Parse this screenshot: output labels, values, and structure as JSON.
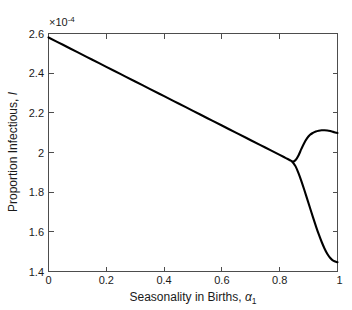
{
  "figure": {
    "background_color": "#ffffff",
    "curve_color": "#000000",
    "axis_color": "#4d4d4d"
  },
  "axes": {
    "x_title_main": "Seasonality in Births, ",
    "x_title_symbol": "α",
    "x_title_subscript": "1",
    "y_title_main": "Proportion Infectious, ",
    "y_title_symbol": "I",
    "exponent_mantissa": "×10",
    "exponent_power": "-4",
    "x_ticklabels": [
      "0",
      "0.2",
      "0.4",
      "0.6",
      "0.8",
      "1"
    ],
    "y_ticklabels": [
      "1.4",
      "1.6",
      "1.8",
      "2",
      "2.2",
      "2.4",
      "2.6"
    ]
  },
  "chart_data": {
    "type": "line",
    "title": "",
    "xlabel": "Seasonality in Births, alpha_1",
    "ylabel": "Proportion Infectious, I",
    "y_scale_exponent": -4,
    "xlim": [
      0,
      1
    ],
    "ylim": [
      1.4,
      2.6
    ],
    "xticks": [
      0,
      0.2,
      0.4,
      0.6,
      0.8,
      1
    ],
    "yticks": [
      1.4,
      1.6,
      1.8,
      2.0,
      2.2,
      2.4,
      2.6
    ],
    "grid": false,
    "legend": null,
    "annotations": [
      {
        "text": "period-doubling bifurcation",
        "x": 0.845,
        "y": 1.95
      }
    ],
    "series": [
      {
        "name": "annual attractor (stable branch)",
        "x": [
          0.0,
          0.05,
          0.1,
          0.15,
          0.2,
          0.25,
          0.3,
          0.35,
          0.4,
          0.45,
          0.5,
          0.55,
          0.6,
          0.65,
          0.7,
          0.75,
          0.8,
          0.82,
          0.84,
          0.845
        ],
        "values": [
          2.58,
          2.543,
          2.506,
          2.469,
          2.432,
          2.395,
          2.358,
          2.321,
          2.284,
          2.247,
          2.21,
          2.173,
          2.136,
          2.099,
          2.062,
          2.025,
          1.988,
          1.973,
          1.958,
          1.952
        ]
      },
      {
        "name": "upper branch (biennial)",
        "x": [
          0.845,
          0.855,
          0.865,
          0.875,
          0.885,
          0.895,
          0.905,
          0.915,
          0.925,
          0.935,
          0.945,
          0.955,
          0.965,
          0.975,
          0.985,
          1.0
        ],
        "values": [
          1.952,
          1.962,
          1.985,
          2.018,
          2.048,
          2.072,
          2.089,
          2.099,
          2.106,
          2.11,
          2.112,
          2.112,
          2.111,
          2.108,
          2.104,
          2.098
        ]
      },
      {
        "name": "lower branch (biennial)",
        "x": [
          0.845,
          0.855,
          0.865,
          0.875,
          0.885,
          0.895,
          0.905,
          0.915,
          0.925,
          0.935,
          0.945,
          0.955,
          0.965,
          0.975,
          0.985,
          1.0
        ],
        "values": [
          1.952,
          1.93,
          1.896,
          1.856,
          1.812,
          1.766,
          1.72,
          1.674,
          1.63,
          1.588,
          1.55,
          1.516,
          1.488,
          1.468,
          1.455,
          1.447
        ]
      }
    ]
  }
}
